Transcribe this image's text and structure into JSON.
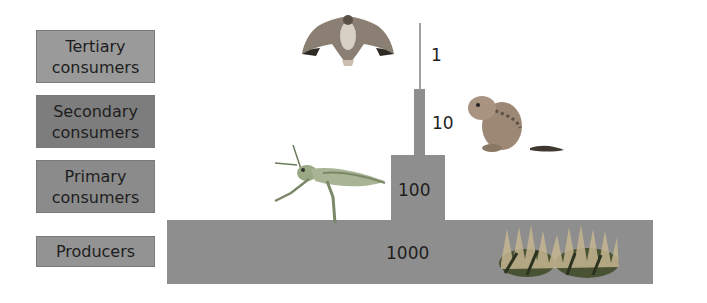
{
  "labels": [
    {
      "text_line1": "Tertiary",
      "text_line2": "consumers",
      "color": "#9a9a9a"
    },
    {
      "text_line1": "Secondary",
      "text_line2": "consumers",
      "color": "#7d7d7d"
    },
    {
      "text_line1": "Primary",
      "text_line2": "consumers",
      "color": "#8b8b8b"
    },
    {
      "text_line1": "Producers",
      "text_line2": "",
      "color": "#939393"
    }
  ],
  "pyramid": {
    "levels": [
      {
        "name": "Tertiary consumers",
        "value": "1",
        "organism": "hawk"
      },
      {
        "name": "Secondary consumers",
        "value": "10",
        "organism": "ground squirrel"
      },
      {
        "name": "Primary consumers",
        "value": "100",
        "organism": "grasshopper"
      },
      {
        "name": "Producers",
        "value": "1000",
        "organism": "grass"
      }
    ],
    "bar_color": "#8e8e8e"
  }
}
